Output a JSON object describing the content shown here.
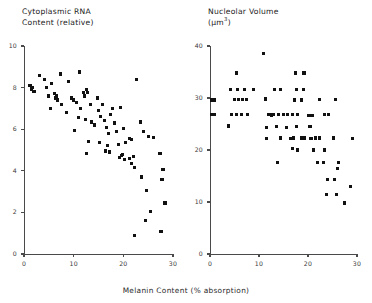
{
  "figure": {
    "shared_xlabel": "Melanin Content (% absorption)"
  },
  "chart_data": [
    {
      "type": "scatter",
      "panel": "left",
      "title": "Cytoplasmic RNA\nContent (relative)",
      "xlabel": "Melanin Content (% absorption)",
      "ylabel": "Cytoplasmic RNA Content (relative)",
      "xlim": [
        0,
        30
      ],
      "ylim": [
        0,
        10
      ],
      "xticks": [
        0,
        10,
        20,
        30
      ],
      "yticks": [
        0,
        2,
        4,
        6,
        8,
        10
      ],
      "grid": false,
      "legend": null,
      "marker": "square",
      "marker_color": "#111111",
      "points": [
        [
          1.2,
          8.1
        ],
        [
          1.5,
          7.9
        ],
        [
          1.6,
          8.0
        ],
        [
          2.0,
          7.8
        ],
        [
          3.2,
          8.6
        ],
        [
          4.1,
          8.4
        ],
        [
          4.6,
          8.0
        ],
        [
          5.0,
          7.6
        ],
        [
          5.6,
          8.2
        ],
        [
          6.2,
          7.7
        ],
        [
          6.4,
          7.5
        ],
        [
          6.6,
          7.6
        ],
        [
          6.8,
          7.4
        ],
        [
          7.4,
          8.65
        ],
        [
          7.6,
          7.2
        ],
        [
          5.4,
          7.0
        ],
        [
          9.0,
          8.3
        ],
        [
          9.6,
          7.5
        ],
        [
          9.9,
          7.4
        ],
        [
          8.6,
          6.8
        ],
        [
          10.6,
          7.3
        ],
        [
          11.2,
          8.75
        ],
        [
          11.4,
          7.0
        ],
        [
          12.0,
          7.75
        ],
        [
          12.2,
          7.6
        ],
        [
          12.6,
          7.9
        ],
        [
          12.8,
          7.75
        ],
        [
          11.0,
          6.55
        ],
        [
          12.4,
          6.45
        ],
        [
          13.4,
          7.2
        ],
        [
          13.6,
          6.35
        ],
        [
          14.2,
          6.2
        ],
        [
          10.2,
          5.95
        ],
        [
          14.8,
          7.5
        ],
        [
          15.0,
          6.9
        ],
        [
          15.4,
          6.6
        ],
        [
          15.8,
          7.2
        ],
        [
          16.2,
          6.4
        ],
        [
          16.6,
          6.1
        ],
        [
          13.0,
          5.4
        ],
        [
          15.2,
          5.35
        ],
        [
          17.0,
          5.8
        ],
        [
          17.4,
          6.7
        ],
        [
          17.8,
          7.0
        ],
        [
          18.2,
          6.3
        ],
        [
          18.6,
          5.9
        ],
        [
          19.4,
          7.05
        ],
        [
          20.0,
          6.05
        ],
        [
          19.0,
          5.25
        ],
        [
          16.8,
          5.2
        ],
        [
          20.4,
          5.35
        ],
        [
          21.2,
          5.55
        ],
        [
          21.6,
          5.5
        ],
        [
          22.6,
          8.4
        ],
        [
          23.4,
          6.35
        ],
        [
          24.0,
          5.9
        ],
        [
          25.0,
          5.65
        ],
        [
          26.0,
          5.6
        ],
        [
          12.6,
          4.85
        ],
        [
          16.4,
          4.95
        ],
        [
          17.2,
          4.9
        ],
        [
          19.2,
          4.65
        ],
        [
          19.6,
          4.75
        ],
        [
          19.8,
          4.8
        ],
        [
          20.2,
          4.55
        ],
        [
          21.2,
          4.6
        ],
        [
          21.6,
          4.35
        ],
        [
          22.0,
          4.7
        ],
        [
          22.2,
          4.15
        ],
        [
          23.6,
          3.7
        ],
        [
          24.6,
          3.05
        ],
        [
          27.4,
          4.85
        ],
        [
          28.0,
          4.05
        ],
        [
          27.8,
          3.6
        ],
        [
          24.4,
          1.6
        ],
        [
          25.4,
          2.05
        ],
        [
          28.4,
          2.45
        ],
        [
          27.6,
          1.1
        ],
        [
          22.2,
          0.9
        ]
      ]
    },
    {
      "type": "scatter",
      "panel": "right",
      "title": "Nucleolar Volume\n(μm³)",
      "xlabel": "Melanin Content (% absorption)",
      "ylabel": "Nucleolar Volume (μm³)",
      "xlim": [
        0,
        30
      ],
      "ylim": [
        0,
        40
      ],
      "xticks": [
        0,
        10,
        20,
        30
      ],
      "yticks": [
        0,
        10,
        20,
        30,
        40
      ],
      "grid": false,
      "legend": null,
      "marker": "square",
      "marker_color": "#111111",
      "points": [
        [
          0.4,
          29.6
        ],
        [
          1.0,
          29.6
        ],
        [
          0.4,
          26.8
        ],
        [
          1.0,
          26.8
        ],
        [
          4.2,
          31.6
        ],
        [
          5.6,
          31.6
        ],
        [
          7.0,
          31.6
        ],
        [
          8.8,
          31.6
        ],
        [
          5.0,
          29.7
        ],
        [
          5.8,
          29.7
        ],
        [
          6.6,
          29.7
        ],
        [
          7.4,
          29.7
        ],
        [
          4.4,
          26.8
        ],
        [
          5.4,
          26.8
        ],
        [
          6.4,
          26.8
        ],
        [
          7.6,
          26.8
        ],
        [
          3.8,
          24.6
        ],
        [
          5.4,
          34.8
        ],
        [
          11.0,
          38.6
        ],
        [
          13.2,
          31.6
        ],
        [
          14.4,
          31.6
        ],
        [
          11.4,
          29.8
        ],
        [
          12.0,
          26.9
        ],
        [
          12.4,
          26.9
        ],
        [
          12.6,
          26.7
        ],
        [
          13.0,
          26.9
        ],
        [
          14.0,
          26.9
        ],
        [
          15.0,
          26.9
        ],
        [
          15.8,
          26.9
        ],
        [
          11.6,
          24.4
        ],
        [
          13.6,
          24.5
        ],
        [
          17.2,
          29.6
        ],
        [
          18.6,
          29.6
        ],
        [
          17.6,
          31.6
        ],
        [
          19.0,
          31.6
        ],
        [
          17.4,
          34.8
        ],
        [
          19.2,
          34.8
        ],
        [
          16.8,
          26.8
        ],
        [
          17.8,
          26.8
        ],
        [
          20.2,
          26.6
        ],
        [
          21.0,
          26.6
        ],
        [
          15.6,
          24.4
        ],
        [
          17.6,
          24.5
        ],
        [
          22.4,
          29.7
        ],
        [
          25.6,
          29.7
        ],
        [
          23.4,
          26.8
        ],
        [
          24.2,
          26.8
        ],
        [
          20.4,
          24.5
        ],
        [
          11.6,
          22.2
        ],
        [
          14.4,
          22.3
        ],
        [
          17.0,
          22.3
        ],
        [
          18.6,
          22.3
        ],
        [
          19.2,
          22.3
        ],
        [
          21.6,
          22.3
        ],
        [
          22.4,
          22.3
        ],
        [
          25.2,
          22.3
        ],
        [
          16.8,
          20.3
        ],
        [
          17.8,
          20.0
        ],
        [
          21.2,
          20.0
        ],
        [
          23.4,
          20.0
        ],
        [
          13.8,
          17.6
        ],
        [
          22.0,
          17.6
        ],
        [
          23.2,
          17.6
        ],
        [
          26.2,
          17.6
        ],
        [
          26.0,
          16.4
        ],
        [
          24.0,
          14.4
        ],
        [
          25.4,
          14.4
        ],
        [
          28.6,
          13.0
        ],
        [
          23.8,
          11.4
        ],
        [
          25.8,
          11.4
        ],
        [
          27.4,
          9.8
        ],
        [
          16.4,
          22.2
        ],
        [
          20.6,
          22.2
        ],
        [
          29.0,
          22.2
        ]
      ]
    }
  ],
  "panels": [
    {
      "id": "left",
      "title_line1": "Cytoplasmic RNA",
      "title_line2": "Content (relative)",
      "y_tick_labels": [
        "10",
        "8",
        "6",
        "4",
        "2",
        "0"
      ],
      "x_tick_labels": [
        "0",
        "10",
        "20",
        "30"
      ]
    },
    {
      "id": "right",
      "title_line1": "Nucleolar Volume",
      "title_line2_pre": "(μm",
      "title_line2_sup": "3",
      "title_line2_post": ")",
      "y_tick_labels": [
        "40",
        "30",
        "20",
        "10",
        "0"
      ],
      "x_tick_labels": [
        "0",
        "10",
        "20",
        "30"
      ]
    }
  ]
}
